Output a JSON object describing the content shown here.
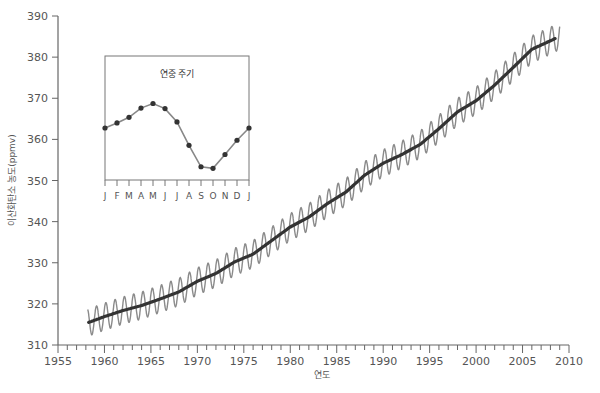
{
  "chart_data": {
    "type": "line",
    "title": "",
    "xlabel": "연도",
    "ylabel": "이산화탄소 농도(ppmv)",
    "xlim": [
      1955,
      2010
    ],
    "ylim": [
      310,
      390
    ],
    "x_ticks": [
      1955,
      1960,
      1965,
      1970,
      1975,
      1980,
      1985,
      1990,
      1995,
      2000,
      2005,
      2010
    ],
    "y_ticks": [
      310,
      320,
      330,
      340,
      350,
      360,
      370,
      380,
      390
    ],
    "grid": false,
    "legend": null,
    "series": [
      {
        "name": "annual_mean_trend",
        "style": "thick dark line",
        "color": "#333333",
        "x": [
          1958.3,
          1960,
          1962,
          1964,
          1966,
          1968,
          1970,
          1972,
          1974,
          1976,
          1978,
          1980,
          1982,
          1984,
          1986,
          1988,
          1990,
          1992,
          1994,
          1996,
          1998,
          2000,
          2002,
          2004,
          2006,
          2008.5
        ],
        "values": [
          315.5,
          316.9,
          318.4,
          319.6,
          321.2,
          322.9,
          325.5,
          327.4,
          330.2,
          332.1,
          335.4,
          338.7,
          341.1,
          344.4,
          347.2,
          351.3,
          354.2,
          356.3,
          358.8,
          362.6,
          366.7,
          369.4,
          373.2,
          377.5,
          381.9,
          384.5
        ]
      },
      {
        "name": "monthly_seasonal",
        "style": "thin grey oscillating line",
        "color": "#8a8a8a",
        "seasonal_amplitude_ppmv": 3.3,
        "x_range": [
          1958.2,
          2009
        ]
      }
    ],
    "inset": {
      "title": "연중 주기",
      "type": "line",
      "categories": [
        "J",
        "F",
        "M",
        "A",
        "M",
        "J",
        "J",
        "A",
        "S",
        "O",
        "N",
        "D",
        "J"
      ],
      "values": [
        0.0,
        1.0,
        2.1,
        3.9,
        4.8,
        3.8,
        1.2,
        -3.4,
        -7.6,
        -7.9,
        -5.2,
        -2.4,
        0.0
      ],
      "markers": true
    }
  }
}
